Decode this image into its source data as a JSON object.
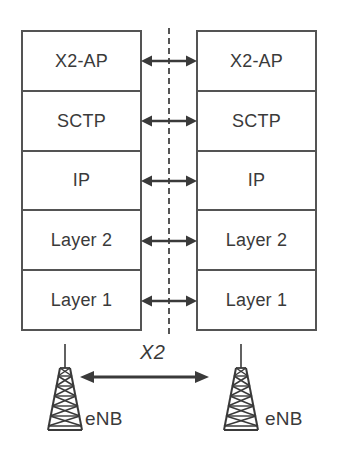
{
  "diagram": {
    "colors": {
      "box_border": "#545454",
      "text": "#3a3a3a",
      "arrow": "#3a3a3a",
      "dashed_line": "#555555",
      "background": "#ffffff"
    },
    "layers": [
      {
        "id": "x2ap",
        "label": "X2-AP"
      },
      {
        "id": "sctp",
        "label": "SCTP"
      },
      {
        "id": "ip",
        "label": "IP"
      },
      {
        "id": "layer2",
        "label": "Layer 2"
      },
      {
        "id": "layer1",
        "label": "Layer 1"
      }
    ],
    "left_stack": {
      "name": "left-enb-stack",
      "layers": [
        {
          "label": "X2-AP"
        },
        {
          "label": "SCTP"
        },
        {
          "label": "IP"
        },
        {
          "label": "Layer 2"
        },
        {
          "label": "Layer 1"
        }
      ]
    },
    "right_stack": {
      "name": "right-enb-stack",
      "layers": [
        {
          "label": "X2-AP"
        },
        {
          "label": "SCTP"
        },
        {
          "label": "IP"
        },
        {
          "label": "Layer 2"
        },
        {
          "label": "Layer 1"
        }
      ]
    },
    "interface": {
      "label": "X2",
      "arrow_style": "double-headed"
    },
    "nodes": {
      "left_label": "eNB",
      "right_label": "eNB",
      "icon": "antenna-tower-icon"
    }
  }
}
